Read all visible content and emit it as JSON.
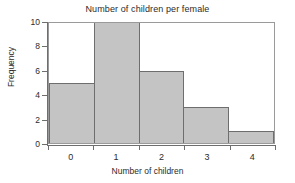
{
  "chart_data": {
    "type": "bar",
    "title": "Number of children per female",
    "xlabel": "Number of children",
    "ylabel": "Frequency",
    "categories": [
      "0",
      "1",
      "2",
      "3",
      "4"
    ],
    "values": [
      5,
      10,
      6,
      3,
      1
    ],
    "x": [
      0,
      1,
      2,
      3,
      4
    ],
    "xlim": [
      -0.5,
      4.5
    ],
    "ylim": [
      0,
      10
    ],
    "ytick_labels": [
      "0",
      "2",
      "4",
      "6",
      "8",
      "10"
    ],
    "ytick_values": [
      0,
      2,
      4,
      6,
      8,
      10
    ],
    "xtick_labels": [
      "0",
      "1",
      "2",
      "3",
      "4"
    ],
    "xtick_values": [
      0,
      1,
      2,
      3,
      4
    ],
    "bar_edges": [
      -0.5,
      0.5,
      1.5,
      2.5,
      3.5,
      4.5
    ],
    "grid": false,
    "legend": false,
    "bar_fill_color": "#c4c4c4",
    "bar_edge_color": "#6e6e6e",
    "axis_color": "#6e6e6e",
    "frame_color": "#9a9a9a",
    "background_color": "#ffffff",
    "text_color": "#2b2b2b"
  }
}
